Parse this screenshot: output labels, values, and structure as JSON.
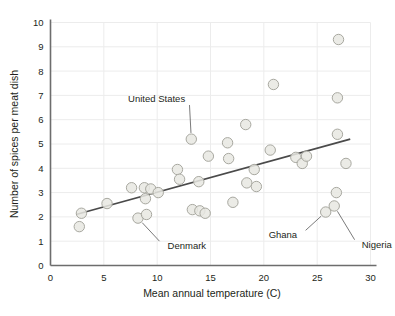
{
  "chart_data": {
    "type": "scatter",
    "title": "",
    "xlabel": "Mean annual temperature (C)",
    "ylabel": "Number of spices per meat dish",
    "xlim": [
      0,
      30
    ],
    "ylim": [
      0,
      10
    ],
    "xticks": [
      "0",
      "5",
      "10",
      "15",
      "20",
      "25",
      "30"
    ],
    "yticks": [
      "0",
      "1",
      "2",
      "3",
      "4",
      "5",
      "6",
      "7",
      "8",
      "9",
      "10"
    ],
    "grid": true,
    "legend": "none",
    "marker_fill": "#e8e8e2",
    "marker_stroke": "#a8a8a0",
    "trendline_color": "#4a4a4a",
    "axis_color": "#6d6d6d",
    "grid_color": "#ececec",
    "points": [
      {
        "x": 2.9,
        "y": 2.15
      },
      {
        "x": 2.7,
        "y": 1.6
      },
      {
        "x": 5.3,
        "y": 2.55
      },
      {
        "x": 7.6,
        "y": 3.2
      },
      {
        "x": 8.2,
        "y": 1.95
      },
      {
        "x": 8.8,
        "y": 3.2
      },
      {
        "x": 8.9,
        "y": 2.75
      },
      {
        "x": 9.0,
        "y": 2.1
      },
      {
        "x": 9.4,
        "y": 3.15
      },
      {
        "x": 10.1,
        "y": 3.0
      },
      {
        "x": 11.9,
        "y": 3.95
      },
      {
        "x": 12.1,
        "y": 3.55
      },
      {
        "x": 13.2,
        "y": 5.2
      },
      {
        "x": 13.3,
        "y": 2.3
      },
      {
        "x": 13.9,
        "y": 3.45
      },
      {
        "x": 14.0,
        "y": 2.25
      },
      {
        "x": 14.5,
        "y": 2.15
      },
      {
        "x": 14.8,
        "y": 4.5
      },
      {
        "x": 16.6,
        "y": 5.05
      },
      {
        "x": 16.7,
        "y": 4.4
      },
      {
        "x": 17.1,
        "y": 2.6
      },
      {
        "x": 18.3,
        "y": 5.8
      },
      {
        "x": 18.4,
        "y": 3.4
      },
      {
        "x": 19.1,
        "y": 3.95
      },
      {
        "x": 19.3,
        "y": 3.25
      },
      {
        "x": 20.6,
        "y": 4.75
      },
      {
        "x": 20.9,
        "y": 7.45
      },
      {
        "x": 23.0,
        "y": 4.45
      },
      {
        "x": 23.6,
        "y": 4.2
      },
      {
        "x": 24.0,
        "y": 4.5
      },
      {
        "x": 25.8,
        "y": 2.2
      },
      {
        "x": 26.6,
        "y": 2.45
      },
      {
        "x": 26.8,
        "y": 3.0
      },
      {
        "x": 26.9,
        "y": 5.4
      },
      {
        "x": 26.9,
        "y": 6.9
      },
      {
        "x": 27.0,
        "y": 9.3
      },
      {
        "x": 27.7,
        "y": 4.2
      }
    ],
    "trendline": {
      "x1": 2.4,
      "y1": 2.1,
      "x2": 28.1,
      "y2": 5.2
    },
    "annotations": [
      {
        "label": "United States",
        "text_x": 13.0,
        "text_y": 6.85,
        "point_x": 13.2,
        "point_y": 5.2
      },
      {
        "label": "Denmark",
        "text_x": 10.6,
        "text_y": 0.82,
        "point_x": 8.2,
        "point_y": 1.95
      },
      {
        "label": "Ghana",
        "text_x": 23.5,
        "text_y": 1.28,
        "point_x": 25.8,
        "point_y": 2.2
      },
      {
        "label": "Nigeria",
        "text_x": 28.8,
        "text_y": 0.85,
        "point_x": 26.6,
        "point_y": 2.45
      }
    ]
  }
}
